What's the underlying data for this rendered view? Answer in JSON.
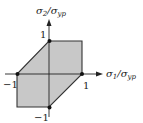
{
  "diagram": {
    "type": "tresca-yield-hexagon",
    "x_axis_label": {
      "main": "σ",
      "sub1": "1",
      "slash": "/σ",
      "sub2": "yp"
    },
    "y_axis_label": {
      "main": "σ",
      "sub1": "2",
      "slash": "/σ",
      "sub2": "yp"
    },
    "tick_labels": {
      "x_pos": "1",
      "x_neg": "−1",
      "y_pos": "1",
      "y_neg": "−1"
    },
    "polygon_vertices": [
      [
        0,
        1
      ],
      [
        1,
        1
      ],
      [
        1,
        0
      ],
      [
        0,
        -1
      ],
      [
        -1,
        -1
      ],
      [
        -1,
        0
      ]
    ],
    "marked_points": [
      [
        0,
        1
      ],
      [
        1,
        0
      ],
      [
        0,
        -1
      ],
      [
        -1,
        0
      ]
    ],
    "colors": {
      "fill": "#c8c8c8",
      "stroke": "#222222",
      "axis": "#222222"
    }
  }
}
